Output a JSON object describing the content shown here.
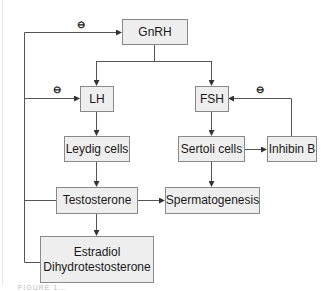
{
  "diagram": {
    "nodes": [
      {
        "id": "gnrh",
        "label": "GnRH"
      },
      {
        "id": "lh",
        "label": "LH"
      },
      {
        "id": "fsh",
        "label": "FSH"
      },
      {
        "id": "leydig",
        "label": "Leydig cells"
      },
      {
        "id": "sertoli",
        "label": "Sertoli cells"
      },
      {
        "id": "inhibin",
        "label": "Inhibin B"
      },
      {
        "id": "testosterone",
        "label": "Testosterone"
      },
      {
        "id": "spermatogenesis",
        "label": "Spermatogenesis"
      },
      {
        "id": "metabolites",
        "label_line1": "Estradiol",
        "label_line2": "Dihydrotestosterone"
      }
    ],
    "edges": [
      {
        "from": "gnrh",
        "to": "lh",
        "type": "stimulate"
      },
      {
        "from": "gnrh",
        "to": "fsh",
        "type": "stimulate"
      },
      {
        "from": "lh",
        "to": "leydig",
        "type": "stimulate"
      },
      {
        "from": "fsh",
        "to": "sertoli",
        "type": "stimulate"
      },
      {
        "from": "leydig",
        "to": "testosterone",
        "type": "stimulate"
      },
      {
        "from": "testosterone",
        "to": "spermatogenesis",
        "type": "stimulate"
      },
      {
        "from": "sertoli",
        "to": "spermatogenesis",
        "type": "stimulate"
      },
      {
        "from": "sertoli",
        "to": "inhibin",
        "type": "stimulate"
      },
      {
        "from": "testosterone",
        "to": "metabolites",
        "type": "stimulate"
      },
      {
        "from": "inhibin",
        "to": "fsh",
        "type": "inhibit"
      },
      {
        "from": "testosterone",
        "to": "lh",
        "type": "inhibit"
      },
      {
        "from": "testosterone",
        "to": "gnrh",
        "type": "inhibit"
      }
    ],
    "inhibit_symbol": "⊖",
    "caption_fragment": "FIGURE 1..."
  },
  "colors": {
    "box_fill": "#eeeeee",
    "box_border": "#8a8a8a",
    "line": "#555555"
  }
}
